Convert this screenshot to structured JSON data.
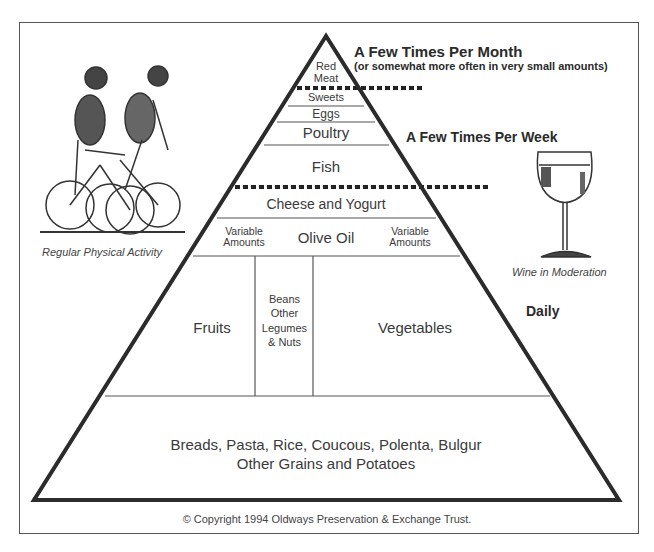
{
  "diagram": {
    "frequency_labels": {
      "monthly": "A Few Times Per Month",
      "monthly_note": "(or somewhat more often in very small amounts)",
      "weekly": "A Few Times Per Week",
      "daily": "Daily"
    },
    "tiers": {
      "red_meat_line1": "Red",
      "red_meat_line2": "Meat",
      "sweets": "Sweets",
      "eggs": "Eggs",
      "poultry": "Poultry",
      "fish": "Fish",
      "cheese": "Cheese and Yogurt",
      "variable_left_1": "Variable",
      "variable_left_2": "Amounts",
      "olive_oil": "Olive Oil",
      "variable_right_1": "Variable",
      "variable_right_2": "Amounts",
      "fruits": "Fruits",
      "beans_1": "Beans",
      "beans_2": "Other",
      "beans_3": "Legumes",
      "beans_4": "& Nuts",
      "vegetables": "Vegetables",
      "grains_1": "Breads, Pasta, Rice, Coucous, Polenta, Bulgur",
      "grains_2": "Other Grains and Potatoes"
    },
    "illustrations": {
      "cyclists_caption": "Regular Physical Activity",
      "wine_caption": "Wine in Moderation"
    },
    "copyright": "© Copyright 1994 Oldways Preservation & Exchange Trust."
  },
  "colors": {
    "line": "#2b2b2b",
    "thin_line": "#555555",
    "text": "#3a3a3a"
  }
}
